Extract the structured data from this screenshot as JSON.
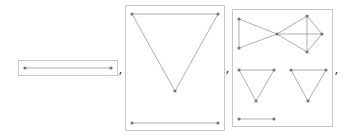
{
  "output": {
    "separator": ",",
    "style": {
      "frame_color": "#c8c8c8",
      "edge_color": "#9a9a9a",
      "vertex_color": "#777777"
    },
    "graphs": [
      {
        "name": "graph-1",
        "description": "single edge (path graph on 2 vertices)",
        "frame": {
          "x": 18,
          "y": 60,
          "w": 100,
          "h": 16
        },
        "vertices": [
          [
            25,
            68
          ],
          [
            111,
            68
          ]
        ],
        "edges": [
          [
            0,
            1
          ]
        ]
      },
      {
        "name": "graph-2",
        "description": "triangle plus disjoint edge",
        "frame": {
          "x": 125,
          "y": 5,
          "w": 100,
          "h": 126
        },
        "vertices": [
          [
            132,
            14
          ],
          [
            218,
            14
          ],
          [
            175,
            91
          ],
          [
            132,
            123
          ],
          [
            218,
            123
          ]
        ],
        "edges": [
          [
            0,
            1
          ],
          [
            0,
            2
          ],
          [
            1,
            2
          ],
          [
            3,
            4
          ]
        ]
      },
      {
        "name": "graph-3",
        "description": "bowtie with K4 component, two triangles and a disjoint edge",
        "frame": {
          "x": 232,
          "y": 9,
          "w": 101,
          "h": 118
        },
        "vertices": [
          [
            239,
            19
          ],
          [
            239,
            48
          ],
          [
            277,
            34
          ],
          [
            307,
            16
          ],
          [
            322,
            34
          ],
          [
            307,
            52
          ],
          [
            239,
            70
          ],
          [
            274,
            70
          ],
          [
            256,
            101
          ],
          [
            291,
            70
          ],
          [
            326,
            70
          ],
          [
            308,
            101
          ],
          [
            239,
            119
          ],
          [
            274,
            119
          ]
        ],
        "edges": [
          [
            0,
            1
          ],
          [
            0,
            2
          ],
          [
            1,
            2
          ],
          [
            2,
            3
          ],
          [
            2,
            4
          ],
          [
            2,
            5
          ],
          [
            3,
            4
          ],
          [
            4,
            5
          ],
          [
            3,
            5
          ],
          [
            6,
            7
          ],
          [
            6,
            8
          ],
          [
            7,
            8
          ],
          [
            9,
            10
          ],
          [
            9,
            11
          ],
          [
            10,
            11
          ],
          [
            12,
            13
          ]
        ]
      }
    ],
    "commas": [
      {
        "x": 119,
        "y": 66
      },
      {
        "x": 226,
        "y": 65
      },
      {
        "x": 335,
        "y": 66
      }
    ]
  }
}
